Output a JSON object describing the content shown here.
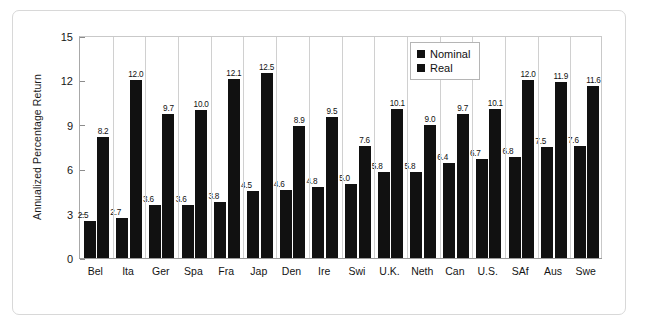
{
  "chart_data": {
    "type": "bar",
    "title": "",
    "subtitle": "",
    "xlabel": "",
    "ylabel": "Annualized Percentage Return",
    "ylim": [
      0,
      15
    ],
    "yticks": [
      "0",
      "3",
      "6",
      "9",
      "12",
      "15"
    ],
    "grid": false,
    "legend_position": "top-right",
    "categories": [
      "Bel",
      "Ita",
      "Ger",
      "Spa",
      "Fra",
      "Jap",
      "Den",
      "Ire",
      "Swi",
      "U.K.",
      "Neth",
      "Can",
      "U.S.",
      "SAf",
      "Aus",
      "Swe"
    ],
    "series": [
      {
        "name": "Real",
        "color": "#111111",
        "values": [
          2.5,
          2.7,
          3.6,
          3.6,
          3.8,
          4.5,
          4.6,
          4.8,
          5.0,
          5.8,
          5.8,
          6.4,
          6.7,
          6.8,
          7.5,
          7.6
        ],
        "labels": [
          "2.5",
          "2.7",
          "3.6",
          "3.6",
          "3.8",
          "4.5",
          "4.6",
          "4.8",
          "5.0",
          "5.8",
          "5.8",
          "6.4",
          "6.7",
          "6.8",
          "7.5",
          "7.6"
        ]
      },
      {
        "name": "Nominal",
        "color": "#111111",
        "values": [
          8.2,
          12.0,
          9.7,
          10.0,
          12.1,
          12.5,
          8.9,
          9.5,
          7.6,
          10.1,
          9.0,
          9.7,
          10.1,
          12.0,
          11.9,
          11.6
        ],
        "labels": [
          "8.2",
          "12.0",
          "9.7",
          "10.0",
          "12.1",
          "12.5",
          "8.9",
          "9.5",
          "7.6",
          "10.1",
          "9.0",
          "9.7",
          "10.1",
          "12.0",
          "11.9",
          "11.6"
        ]
      }
    ],
    "legend": [
      "Nominal",
      "Real"
    ]
  }
}
